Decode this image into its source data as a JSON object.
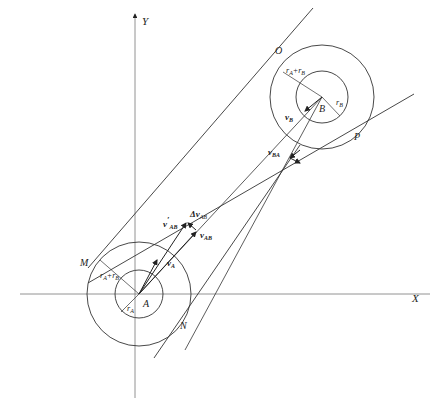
{
  "diagram": {
    "axes": {
      "x_label": "X",
      "y_label": "Y"
    },
    "points": {
      "A": "A",
      "B": "B",
      "M": "M",
      "N": "N",
      "O": "O",
      "P": "P"
    },
    "radii": {
      "rA": "r",
      "rA_sub": "A",
      "rB": "r",
      "rB_sub": "B",
      "sum_at_A": {
        "r1": "r",
        "s1": "A",
        "plus": "+r",
        "s2": "B"
      },
      "sum_at_B": {
        "r1": "r",
        "s1": "A",
        "plus": "+r",
        "s2": "B"
      }
    },
    "vectors": {
      "vA": {
        "main": "v",
        "sub": "A"
      },
      "vB": {
        "main": "v",
        "sub": "B"
      },
      "vAB": {
        "main": "v",
        "sub": "AB"
      },
      "vAB_prime": {
        "main": "v",
        "prime": "′",
        "sub": "AB"
      },
      "dvAB": {
        "main": "Δv",
        "sub": "AB"
      },
      "vBA": {
        "main": "v",
        "sub": "BA"
      }
    },
    "colors": {
      "line": "#333333",
      "axis": "#666666",
      "background": "#ffffff"
    }
  }
}
